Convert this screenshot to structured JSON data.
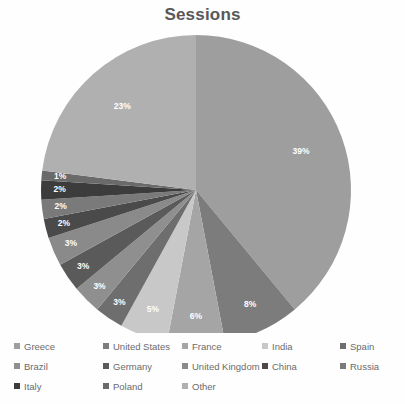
{
  "chart_data": {
    "type": "pie",
    "title": "Sessions",
    "xlabel": "",
    "ylabel": "",
    "legend_position": "bottom",
    "grid": false,
    "categories": [
      "Greece",
      "United States",
      "France",
      "India",
      "Spain",
      "Brazil",
      "Germany",
      "United Kingdom",
      "China",
      "Russia",
      "Italy",
      "Poland",
      "Other"
    ],
    "values": [
      39,
      8,
      6,
      5,
      3,
      3,
      3,
      3,
      2,
      2,
      2,
      1,
      23
    ],
    "value_unit": "%",
    "data_labels": [
      "39%",
      "8%",
      "6%",
      "5%",
      "3%",
      "3%",
      "3%",
      "3%",
      "2%",
      "2%",
      "2%",
      "1%",
      "23%"
    ],
    "colors": [
      "#9e9e9e",
      "#7c7c7c",
      "#a5a5a5",
      "#c8c8c8",
      "#6e6e6e",
      "#8f8f8f",
      "#5a5a5a",
      "#8a8a8a",
      "#4a4a4a",
      "#7a7a7a",
      "#3c3c3c",
      "#6a6a6a",
      "#b0b0b0"
    ],
    "slices": [
      {
        "label": "Greece",
        "value": 39,
        "data_label": "39%",
        "color": "#9e9e9e"
      },
      {
        "label": "United States",
        "value": 8,
        "data_label": "8%",
        "color": "#7c7c7c"
      },
      {
        "label": "France",
        "value": 6,
        "data_label": "6%",
        "color": "#a5a5a5"
      },
      {
        "label": "India",
        "value": 5,
        "data_label": "5%",
        "color": "#c8c8c8"
      },
      {
        "label": "Spain",
        "value": 3,
        "data_label": "3%",
        "color": "#6e6e6e"
      },
      {
        "label": "Brazil",
        "value": 3,
        "data_label": "3%",
        "color": "#8f8f8f"
      },
      {
        "label": "Germany",
        "value": 3,
        "data_label": "3%",
        "color": "#5a5a5a"
      },
      {
        "label": "United Kingdom",
        "value": 3,
        "data_label": "3%",
        "color": "#8a8a8a"
      },
      {
        "label": "China",
        "value": 2,
        "data_label": "2%",
        "color": "#4a4a4a"
      },
      {
        "label": "Russia",
        "value": 2,
        "data_label": "2%",
        "color": "#7a7a7a"
      },
      {
        "label": "Italy",
        "value": 2,
        "data_label": "2%",
        "color": "#3c3c3c"
      },
      {
        "label": "Poland",
        "value": 1,
        "data_label": "1%",
        "color": "#6a6a6a"
      },
      {
        "label": "Other",
        "value": 23,
        "data_label": "23%",
        "color": "#b0b0b0"
      }
    ]
  },
  "legend": {
    "rows": [
      [
        {
          "label": "Greece",
          "color": "#9e9e9e"
        },
        {
          "label": "United States",
          "color": "#7c7c7c"
        },
        {
          "label": "France",
          "color": "#a5a5a5"
        },
        {
          "label": "India",
          "color": "#c8c8c8"
        },
        {
          "label": "Spain",
          "color": "#6e6e6e"
        }
      ],
      [
        {
          "label": "Brazil",
          "color": "#8f8f8f"
        },
        {
          "label": "Germany",
          "color": "#5a5a5a"
        },
        {
          "label": "United Kingdom",
          "color": "#8a8a8a"
        },
        {
          "label": "China",
          "color": "#4a4a4a"
        },
        {
          "label": "Russia",
          "color": "#7a7a7a"
        }
      ],
      [
        {
          "label": "Italy",
          "color": "#3c3c3c"
        },
        {
          "label": "Poland",
          "color": "#6a6a6a"
        },
        {
          "label": "Other",
          "color": "#b0b0b0"
        }
      ]
    ]
  }
}
